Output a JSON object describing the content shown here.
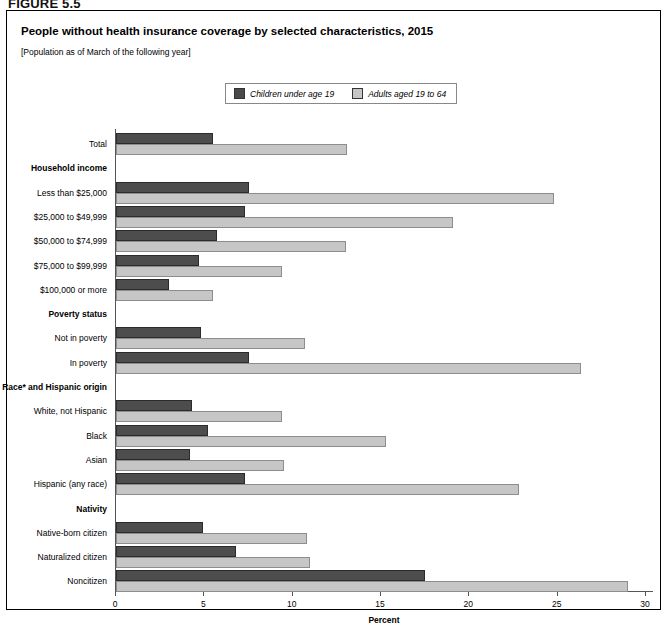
{
  "figure_label": "FIGURE 5.5",
  "panel": {
    "title": "People without health insurance coverage by selected characteristics, 2015",
    "subtitle": "[Population as of March of the following year]"
  },
  "legend": {
    "position": "top-center",
    "items": [
      {
        "label": "Children under age 19",
        "color": "#4d4d4d",
        "swatch": "dark-swatch"
      },
      {
        "label": "Adults aged 19 to 64",
        "color": "#c6c6c6",
        "swatch": "light-swatch"
      }
    ]
  },
  "chart_data": {
    "type": "bar",
    "orientation": "horizontal",
    "title": "People without health insurance coverage by selected characteristics, 2015",
    "subtitle": "[Population as of March of the following year]",
    "xlabel": "Percent",
    "ylabel": "",
    "xlim": [
      0,
      30
    ],
    "xticks": [
      0,
      5,
      10,
      15,
      20,
      25,
      30
    ],
    "xticklabels": [
      "0",
      "5",
      "10",
      "15",
      "20",
      "25",
      "30"
    ],
    "grid": false,
    "legend_position": "top-center",
    "rows": [
      {
        "label": "Total",
        "type": "data",
        "children": 5.5,
        "adults": 13.1
      },
      {
        "label": "Household income",
        "type": "header",
        "children": null,
        "adults": null
      },
      {
        "label": "Less than $25,000",
        "type": "data",
        "children": 7.5,
        "adults": 24.8
      },
      {
        "label": "$25,000 to $49,999",
        "type": "data",
        "children": 7.3,
        "adults": 19.1
      },
      {
        "label": "$50,000 to $74,999",
        "type": "data",
        "children": 5.7,
        "adults": 13.0
      },
      {
        "label": "$75,000 to $99,999",
        "type": "data",
        "children": 4.7,
        "adults": 9.4
      },
      {
        "label": "$100,000 or more",
        "type": "data",
        "children": 3.0,
        "adults": 5.5
      },
      {
        "label": "Poverty status",
        "type": "header",
        "children": null,
        "adults": null
      },
      {
        "label": "Not in poverty",
        "type": "data",
        "children": 4.8,
        "adults": 10.7
      },
      {
        "label": "In poverty",
        "type": "data",
        "children": 7.5,
        "adults": 26.3
      },
      {
        "label": "Race* and Hispanic origin",
        "type": "header",
        "children": null,
        "adults": null
      },
      {
        "label": "White, not Hispanic",
        "type": "data",
        "children": 4.3,
        "adults": 9.4
      },
      {
        "label": "Black",
        "type": "data",
        "children": 5.2,
        "adults": 15.3
      },
      {
        "label": "Asian",
        "type": "data",
        "children": 4.2,
        "adults": 9.5
      },
      {
        "label": "Hispanic (any race)",
        "type": "data",
        "children": 7.3,
        "adults": 22.8
      },
      {
        "label": "Nativity",
        "type": "header",
        "children": null,
        "adults": null
      },
      {
        "label": "Native-born citizen",
        "type": "data",
        "children": 4.9,
        "adults": 10.8
      },
      {
        "label": "Naturalized citizen",
        "type": "data",
        "children": 6.8,
        "adults": 11.0
      },
      {
        "label": "Noncitizen",
        "type": "data",
        "children": 17.5,
        "adults": 29.0
      }
    ],
    "series": [
      {
        "name": "Children under age 19",
        "color": "#4d4d4d",
        "values": [
          5.5,
          null,
          7.5,
          7.3,
          5.7,
          4.7,
          3.0,
          null,
          4.8,
          7.5,
          null,
          4.3,
          5.2,
          4.2,
          7.3,
          null,
          4.9,
          6.8,
          17.5
        ]
      },
      {
        "name": "Adults aged 19 to 64",
        "color": "#c6c6c6",
        "values": [
          13.1,
          null,
          24.8,
          19.1,
          13.0,
          9.4,
          5.5,
          null,
          10.7,
          26.3,
          null,
          9.4,
          15.3,
          9.5,
          22.8,
          null,
          10.8,
          11.0,
          29.0
        ]
      }
    ],
    "categories": [
      "Total",
      "Household income",
      "Less than $25,000",
      "$25,000 to $49,999",
      "$50,000 to $74,999",
      "$75,000 to $99,999",
      "$100,000 or more",
      "Poverty status",
      "Not in poverty",
      "In poverty",
      "Race* and Hispanic origin",
      "White, not Hispanic",
      "Black",
      "Asian",
      "Hispanic (any race)",
      "Nativity",
      "Native-born citizen",
      "Naturalized citizen",
      "Noncitizen"
    ]
  }
}
